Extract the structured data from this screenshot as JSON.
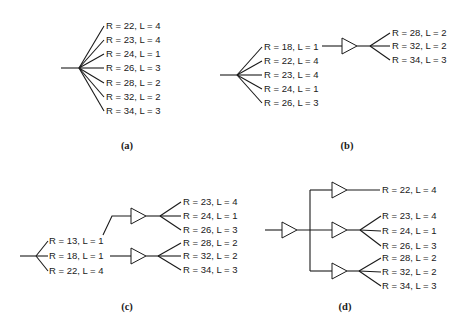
{
  "figure": {
    "panels": [
      {
        "id": "a",
        "caption": "(a)",
        "root_sinks": [
          "R = 22, L = 4",
          "R = 23, L = 4",
          "R = 24, L = 1",
          "R = 26, L = 3",
          "R = 28, L = 2",
          "R = 32, L = 2",
          "R = 34, L = 3"
        ]
      },
      {
        "id": "b",
        "caption": "(b)",
        "root_sinks": [
          "R = 18, L = 1",
          "R = 22, L = 4",
          "R = 23, L = 4",
          "R = 24, L = 1",
          "R = 26, L = 3"
        ],
        "buffered_sinks": [
          "R = 28, L = 2",
          "R = 32, L = 2",
          "R = 34, L = 3"
        ]
      },
      {
        "id": "c",
        "caption": "(c)",
        "root_sinks": [
          "R = 13, L = 1",
          "R = 18, L = 1",
          "R = 22, L = 4"
        ],
        "buffer_top_sinks": [
          "R = 23, L = 4",
          "R = 24, L = 1",
          "R = 26, L = 3"
        ],
        "buffer_bottom_sinks": [
          "R = 28, L = 2",
          "R = 32, L = 2",
          "R = 34, L = 3"
        ]
      },
      {
        "id": "d",
        "caption": "(d)",
        "buffer_top_sinks": [
          "R = 22, L = 4"
        ],
        "buffer_mid_sinks": [
          "R = 23, L = 4",
          "R = 24, L = 1",
          "R = 26, L = 3"
        ],
        "buffer_bottom_sinks": [
          "R = 28, L = 2",
          "R = 32, L = 2",
          "R = 34, L = 3"
        ]
      }
    ]
  }
}
